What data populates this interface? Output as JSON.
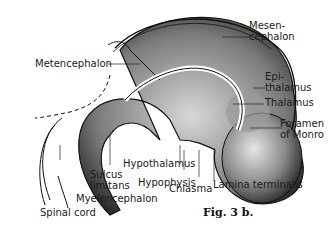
{
  "figure": {
    "caption": "Fig. 3 b.",
    "labels": {
      "metencephalon": "Metencephalon",
      "mesencephalon_1": "Mesen-",
      "mesencephalon_2": "cephalon",
      "epithalamus_1": "Epi-",
      "epithalamus_2": "thalamus",
      "thalamus": "Thalamus",
      "foramen_1": "Foramen",
      "foramen_2": "of Monro",
      "hypothalamus": "Hypothalamus",
      "sulcus_1": "Sulcus",
      "sulcus_2": "limitans",
      "hypophysis": "Hypophysis",
      "chiasma": "Chiasma",
      "lamina": "Lamina terminalis",
      "myelencephalon": "Myelencephalon",
      "spinal_cord": "Spinal cord"
    }
  }
}
